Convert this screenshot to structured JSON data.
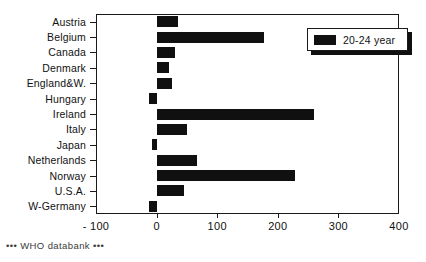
{
  "footer": {
    "text": "••• WHO databank •••"
  },
  "legend": {
    "entries": [
      {
        "label": "20-24 year",
        "color": "#101010"
      }
    ]
  },
  "chart_data": {
    "type": "bar",
    "orientation": "horizontal",
    "title": "",
    "xlabel": "",
    "ylabel": "",
    "xlim": [
      -100,
      400
    ],
    "xticks": [
      -100,
      0,
      100,
      200,
      300,
      400
    ],
    "xtick_labels": [
      "- 100",
      "0",
      "100",
      "200",
      "300",
      "400"
    ],
    "grid": false,
    "legend_position": "top-right",
    "bar_color": "#101010",
    "categories": [
      "Austria",
      "Belgium",
      "Canada",
      "Denmark",
      "England&W.",
      "Hungary",
      "Ireland",
      "Italy",
      "Japan",
      "Netherlands",
      "Norway",
      "U.S.A.",
      "W-Germany"
    ],
    "series": [
      {
        "name": "20-24 year",
        "values": [
          35,
          178,
          30,
          21,
          25,
          -12,
          259,
          50,
          -8,
          67,
          229,
          45,
          -12
        ]
      }
    ]
  }
}
